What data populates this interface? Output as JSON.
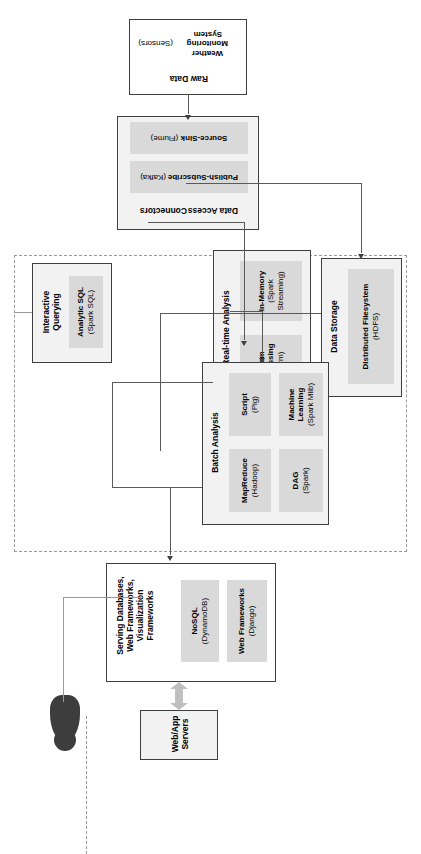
{
  "diagram": {
    "accent_fill": "#d9d9d9",
    "group_fill": "#f2f2f2",
    "border_color": "#3f3f3f",
    "dashed_color": "#9a9a9a",
    "actor_color": "#3d3d3d"
  },
  "actor": {
    "name": "user-actor",
    "label": ""
  },
  "groups": {
    "web_app_servers": {
      "title": "Web/App\nServers",
      "title_line1": "Web/App",
      "title_line2": "Servers"
    },
    "serving": {
      "title_lines": [
        "Serving Databases,",
        "Web Frameworks,",
        "Visualization",
        "Frameworks"
      ],
      "components": [
        {
          "name": "NoSQL",
          "detail": "(DynamoDB)"
        },
        {
          "name": "Web Frameworks",
          "detail": "(Django)"
        }
      ]
    },
    "interactive_querying": {
      "title": "Interactive Querying",
      "title_lines": [
        "Interactive",
        "Querying"
      ],
      "components": [
        {
          "name": "Analytic SQL",
          "detail": "(Spark SQL)"
        }
      ]
    },
    "batch_analysis": {
      "title": "Batch Analysis",
      "components": [
        {
          "name": "MapReduce",
          "detail": "(Hadoop)"
        },
        {
          "name": "Script",
          "detail": "(Pig)"
        },
        {
          "name": "DAG",
          "detail": "(Spark)"
        },
        {
          "name": "Machine Learning",
          "detail": "(Spark Mlib)"
        }
      ]
    },
    "realtime_analysis": {
      "title": "Real-time Analysis",
      "components": [
        {
          "name": "Stream Processing",
          "detail": "(Storm)"
        },
        {
          "name": "In-Memory",
          "detail": "(Spark Streaming)"
        }
      ]
    },
    "data_storage": {
      "title": "Data Storage",
      "components": [
        {
          "name": "Distributed Filesystem",
          "detail": "(HDFS)"
        }
      ]
    },
    "data_access_connectors": {
      "title": "Data Access Connectors",
      "title_lines": [
        "Data Access",
        "Connectors"
      ],
      "components": [
        {
          "name": "Publish-Subscribe",
          "detail": "(Kafka)"
        },
        {
          "name": "Source-Sink",
          "detail": "(Flume)"
        }
      ]
    },
    "raw_data": {
      "title": "Raw Data",
      "components": [
        {
          "name": "Weather Monitoring System",
          "detail": "(Sensors)"
        }
      ]
    }
  }
}
